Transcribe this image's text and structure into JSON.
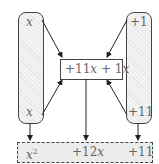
{
  "diagram": {
    "left_pill": {
      "top_label": "x",
      "bottom_label": "x"
    },
    "right_pill": {
      "top_label": "+1",
      "bottom_label": "+11"
    },
    "middle_box": {
      "term1": "+11",
      "var1": "x",
      "plus": " + ",
      "term2": "1",
      "var2": "x"
    },
    "result_row": {
      "t1_var": "x",
      "t1_exp": "2",
      "t2_coef": "+12",
      "t2_var": "x",
      "t3": "+11"
    }
  }
}
